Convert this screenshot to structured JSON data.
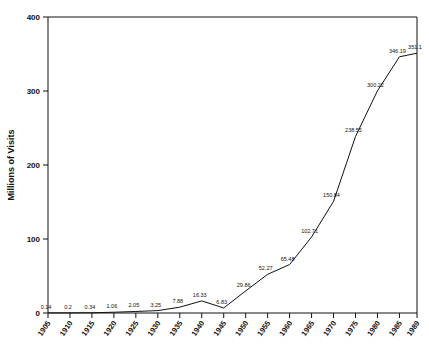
{
  "chart_data": {
    "type": "line",
    "title": "",
    "xlabel": "",
    "ylabel": "Millions of Visits",
    "ylim": [
      0,
      400
    ],
    "yticks": [
      0,
      100,
      200,
      300,
      400
    ],
    "grid": false,
    "legend": null,
    "categories": [
      "1905",
      "1910",
      "1915",
      "1920",
      "1925",
      "1930",
      "1935",
      "1940",
      "1945",
      "1950",
      "1955",
      "1960",
      "1965",
      "1970",
      "1975",
      "1980",
      "1985",
      "1989"
    ],
    "x": [
      1905,
      1910,
      1915,
      1920,
      1925,
      1930,
      1935,
      1940,
      1945,
      1950,
      1955,
      1960,
      1965,
      1970,
      1975,
      1980,
      1985,
      1989
    ],
    "values": [
      0.14,
      0.2,
      0.34,
      1.06,
      2.05,
      3.25,
      7.88,
      16.33,
      6.83,
      29.86,
      52.27,
      65.48,
      102.71,
      150.84,
      238.55,
      300.22,
      346.19,
      351.1
    ],
    "point_labels": [
      "0.14",
      "0.2",
      "0.34",
      "1.06",
      "2.05",
      "3.25",
      "7.88",
      "16.33",
      "6.83",
      "29.86",
      "52.27",
      "65.48",
      "102.71",
      "150.84",
      "238.55",
      "300.22",
      "346.19",
      "351.1"
    ],
    "xlim": [
      1905,
      1989
    ]
  },
  "axes": {
    "y_title": "Millions of Visits",
    "y_tick_labels": [
      "0",
      "100",
      "200",
      "300",
      "400"
    ],
    "x_tick_labels": [
      "1905",
      "1910",
      "1915",
      "1920",
      "1925",
      "1930",
      "1935",
      "1940",
      "1945",
      "1950",
      "1955",
      "1960",
      "1965",
      "1970",
      "1975",
      "1980",
      "1985",
      "1989"
    ]
  },
  "colors": {
    "line": "#111111",
    "axis": "#111111",
    "background": "#ffffff"
  }
}
